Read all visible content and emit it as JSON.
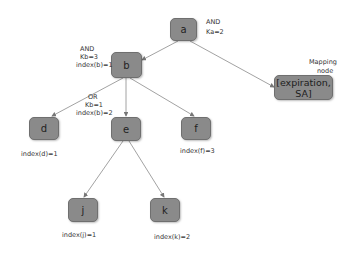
{
  "diagram": {
    "nodes": {
      "a": {
        "label": "a"
      },
      "b": {
        "label": "b"
      },
      "d": {
        "label": "d"
      },
      "e": {
        "label": "e"
      },
      "f": {
        "label": "f"
      },
      "j": {
        "label": "j"
      },
      "k": {
        "label": "k"
      },
      "mapping": {
        "label": "[expiration, SA]"
      }
    },
    "annotations": {
      "a_op": "AND",
      "a_k": "Ka=2",
      "b_op": "AND",
      "b_k": "Kb=3",
      "b_index": "index(b)=1",
      "e_op": "OR",
      "e_k": "Kb=1",
      "e_index": "index(b)=2",
      "d_index": "index(d)=1",
      "f_index": "index(f)=3",
      "j_index": "index(j)=1",
      "k_index": "index(k)=2",
      "mapping_label_1": "Mapping",
      "mapping_label_2": "node"
    },
    "edges": [
      [
        "a",
        "b"
      ],
      [
        "a",
        "mapping"
      ],
      [
        "b",
        "d"
      ],
      [
        "b",
        "e"
      ],
      [
        "b",
        "f"
      ],
      [
        "e",
        "j"
      ],
      [
        "e",
        "k"
      ]
    ],
    "colors": {
      "node_fill": "#8a8a8a",
      "edge": "#7a7a7a"
    }
  }
}
